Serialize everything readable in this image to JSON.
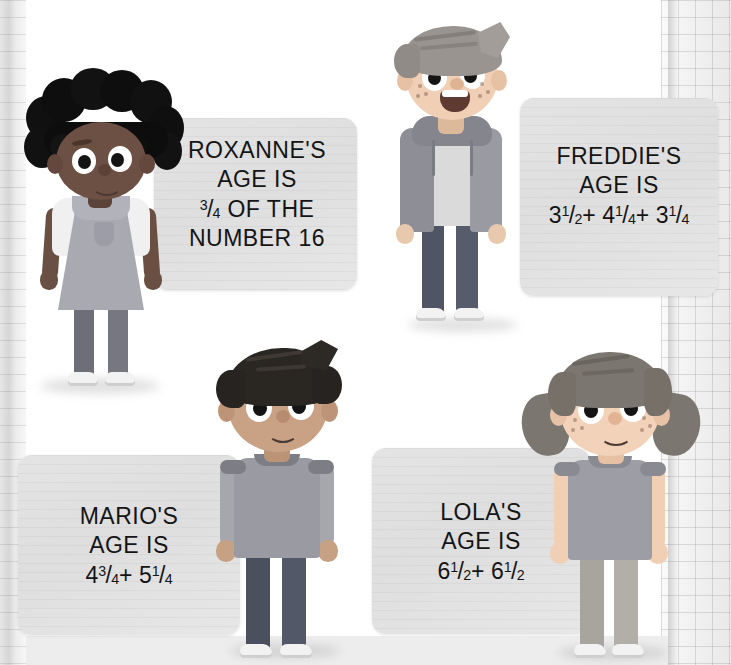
{
  "page": {
    "background_color": "#ffffff",
    "card_color": "#e2e2e2",
    "text_color": "#141414"
  },
  "cards": [
    {
      "id": "roxanne",
      "name": "Roxanne",
      "line1": "ROXANNE'S",
      "line2": "AGE IS",
      "line3_prefix": "",
      "fraction": {
        "whole": "",
        "numerator": "3",
        "denominator": "4"
      },
      "line3_suffix": " OF THE",
      "line4": "NUMBER 16",
      "expression": "3/4 of the number 16"
    },
    {
      "id": "freddie",
      "name": "Freddie",
      "line1": "FREDDIE'S",
      "line2": "AGE IS",
      "terms": [
        {
          "whole": "3",
          "numerator": "1",
          "denominator": "2"
        },
        {
          "whole": "4",
          "numerator": "1",
          "denominator": "4"
        },
        {
          "whole": "3",
          "numerator": "1",
          "denominator": "4"
        }
      ],
      "operator": "+",
      "expression": "3 1/2 + 4 1/4 + 3 1/4"
    },
    {
      "id": "mario",
      "name": "Mario",
      "line1": "MARIO'S",
      "line2": "AGE IS",
      "terms": [
        {
          "whole": "4",
          "numerator": "3",
          "denominator": "4"
        },
        {
          "whole": "5",
          "numerator": "1",
          "denominator": "4"
        }
      ],
      "operator": "+",
      "expression": "4 3/4 + 5 1/4"
    },
    {
      "id": "lola",
      "name": "Lola",
      "line1": "LOLA'S",
      "line2": "AGE IS",
      "terms": [
        {
          "whole": "6",
          "numerator": "1",
          "denominator": "2"
        },
        {
          "whole": "6",
          "numerator": "1",
          "denominator": "2"
        }
      ],
      "operator": "+",
      "expression": "6 1/2 + 6 1/2"
    }
  ],
  "characters": [
    {
      "id": "roxanne",
      "name": "Roxanne",
      "description": "girl with curly black afro puff hair, pinafore dress with pocket, leggings, sneakers"
    },
    {
      "id": "freddie",
      "name": "Freddie",
      "description": "boy with swept hair and freckles, open zip hoodie with drawstrings, t-shirt, dark jeans, sneakers"
    },
    {
      "id": "mario",
      "name": "Mario",
      "description": "boy with dark wavy hair, t-shirt with contrast collar and cuffs, dark jeans, sneakers"
    },
    {
      "id": "lola",
      "name": "Lola",
      "description": "girl with pigtails and freckles, t-shirt, light jeans, sneakers"
    }
  ]
}
